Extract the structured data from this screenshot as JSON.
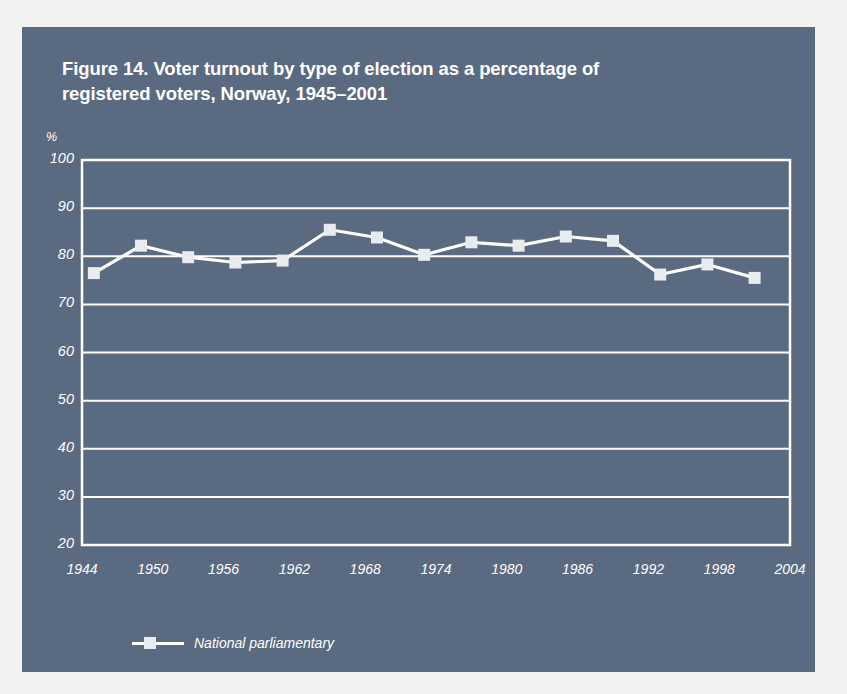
{
  "figure": {
    "title_line1": "Figure 14. Voter turnout by type of election as a percentage of",
    "title_line2": "registered voters, Norway, 1945–2001",
    "panel_color": "#5a6a80",
    "ink_color": "#ffffff",
    "page_color": "#f2f2f0"
  },
  "legend": {
    "position": "bottom-left",
    "entries": [
      {
        "label": "National parliamentary",
        "marker": "square",
        "color": "#e8ecef"
      }
    ]
  },
  "chart_data": {
    "type": "line",
    "title": "Figure 14. Voter turnout by type of election as a percentage of registered voters, Norway, 1945–2001",
    "xlabel": "",
    "ylabel": "",
    "yunit": "%",
    "xlim": [
      1944,
      2004
    ],
    "ylim": [
      20,
      100
    ],
    "yticks": [
      20,
      30,
      40,
      50,
      60,
      70,
      80,
      90,
      100
    ],
    "xticks": [
      1944,
      1950,
      1956,
      1962,
      1968,
      1974,
      1980,
      1986,
      1992,
      1998,
      2004
    ],
    "grid": "horizontal",
    "legend_position": "bottom-left",
    "series": [
      {
        "name": "National parliamentary",
        "color": "#ffffff",
        "marker_color": "#e8ecef",
        "x": [
          1945,
          1949,
          1953,
          1957,
          1961,
          1965,
          1969,
          1973,
          1977,
          1981,
          1985,
          1989,
          1993,
          1997,
          2001
        ],
        "values": [
          76.5,
          82.2,
          79.8,
          78.7,
          79.1,
          85.5,
          83.9,
          80.3,
          82.9,
          82.2,
          84.1,
          83.2,
          76.2,
          78.3,
          75.5
        ]
      }
    ]
  }
}
